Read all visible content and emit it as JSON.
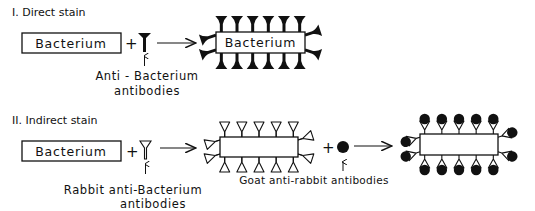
{
  "sections": [
    {
      "id": "direct",
      "title": "I. Direct stain",
      "bacterium_label": "Bacterium",
      "plus": "+",
      "reagent": {
        "name": "anti-bacterium-antibody",
        "caption_line1": "Anti - Bacterium",
        "caption_line2": "antibodies"
      },
      "result": {
        "bacterium_label": "Bacterium",
        "antibodies_top": 6,
        "antibodies_bottom": 6,
        "antibodies_each_side": 2
      }
    },
    {
      "id": "indirect",
      "title": "II. Indirect stain",
      "bacterium_label": "Bacterium",
      "plus": "+",
      "reagent": {
        "name": "rabbit-anti-bacterium-antibody",
        "caption_line1": "Rabbit anti-Bacterium",
        "caption_line2": "antibodies"
      },
      "intermediate": {
        "antibodies_top": 5,
        "antibodies_bottom": 5,
        "antibodies_each_side": 2
      },
      "plus2": "+",
      "secondary_reagent": {
        "name": "goat-anti-rabbit-antibody",
        "caption": "Goat anti-rabbit antibodies"
      },
      "result": {
        "antibodies_top": 5,
        "antibodies_bottom": 5,
        "antibodies_each_side": 2
      }
    }
  ]
}
